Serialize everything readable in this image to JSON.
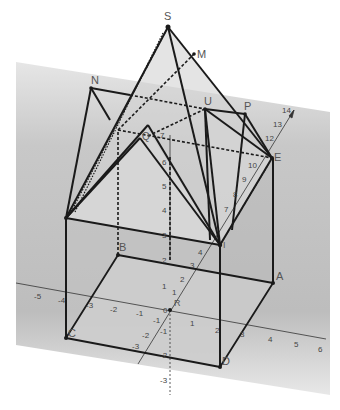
{
  "diagram": {
    "type": "3d-geometry",
    "colors": {
      "background": "#ffffff",
      "plane_shade": "#bdbdbd",
      "face_shade": "#d9d9d9",
      "edge": "#1a1a1a",
      "axis": "#333333",
      "label": "#555555"
    },
    "points": {
      "S": {
        "label": "S",
        "x": 168,
        "y": 27
      },
      "M": {
        "label": "M",
        "x": 194,
        "y": 54
      },
      "N": {
        "label": "N",
        "x": 91,
        "y": 88
      },
      "U": {
        "label": "U",
        "x": 205,
        "y": 109
      },
      "P": {
        "label": "P",
        "x": 245,
        "y": 114
      },
      "E": {
        "label": "E",
        "x": 272,
        "y": 158
      },
      "Q": {
        "label": "Q",
        "x": 148,
        "y": 136
      },
      "I": {
        "label": "I",
        "x": 220,
        "y": 245
      },
      "B": {
        "label": "B",
        "x": 118,
        "y": 255
      },
      "A": {
        "label": "A",
        "x": 273,
        "y": 283
      },
      "C": {
        "label": "C",
        "x": 66,
        "y": 338
      },
      "D": {
        "label": "D",
        "x": 220,
        "y": 367
      },
      "R": {
        "label": "R",
        "x": 175,
        "y": 302
      }
    },
    "axes": {
      "x_ticks": [
        "-5",
        "-4",
        "-3",
        "-2",
        "-1",
        "0",
        "1",
        "2",
        "3",
        "4",
        "5",
        "6"
      ],
      "y_ticks": [
        "-3",
        "-2",
        "-1",
        "1",
        "2",
        "3",
        "4",
        "7",
        "8",
        "9",
        "10",
        "12",
        "13",
        "14"
      ],
      "z_ticks": [
        "-3",
        "-2",
        "-1",
        "1",
        "2",
        "3",
        "4",
        "5",
        "6",
        "7"
      ],
      "origin_label": "0"
    }
  }
}
